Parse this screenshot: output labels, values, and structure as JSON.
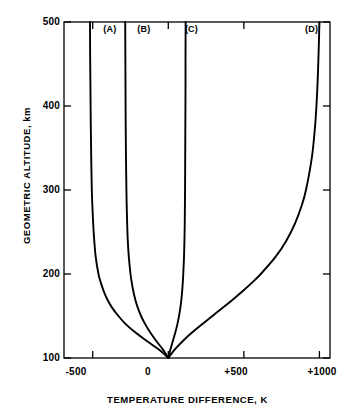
{
  "chart_data": {
    "type": "line",
    "title": "",
    "xlabel": "TEMPERATURE DIFFERENCE, K",
    "ylabel": "GEOMETRIC ALTITUDE, km",
    "xlim": [
      -690,
      1070
    ],
    "ylim": [
      100,
      500
    ],
    "xticks": [
      -500,
      0,
      500,
      1000
    ],
    "xticklabels": [
      "-500",
      "0",
      "+500",
      "+1000"
    ],
    "yticks": [
      100,
      200,
      300,
      400,
      500
    ],
    "yticklabels": [
      "100",
      "200",
      "300",
      "400",
      "500"
    ],
    "grid": false,
    "legend_position": "inline-at-curve-tops",
    "annotations": [
      {
        "text": "(A)",
        "x": -430,
        "y": 492
      },
      {
        "text": "(B)",
        "x": -205,
        "y": 492
      },
      {
        "text": "(C)",
        "x": 110,
        "y": 492
      },
      {
        "text": "(D)",
        "x": 905,
        "y": 492
      }
    ],
    "series": [
      {
        "name": "(A)",
        "label": "(A)",
        "color": "#000000",
        "points": [
          {
            "x": 0,
            "y": 100
          },
          {
            "x": -62,
            "y": 110
          },
          {
            "x": -140,
            "y": 120
          },
          {
            "x": -215,
            "y": 130
          },
          {
            "x": -280,
            "y": 140
          },
          {
            "x": -330,
            "y": 150
          },
          {
            "x": -372,
            "y": 160
          },
          {
            "x": -404,
            "y": 170
          },
          {
            "x": -428,
            "y": 180
          },
          {
            "x": -447,
            "y": 190
          },
          {
            "x": -462,
            "y": 200
          },
          {
            "x": -480,
            "y": 220
          },
          {
            "x": -490,
            "y": 240
          },
          {
            "x": -497,
            "y": 260
          },
          {
            "x": -502,
            "y": 280
          },
          {
            "x": -506,
            "y": 300
          },
          {
            "x": -510,
            "y": 340
          },
          {
            "x": -513,
            "y": 380
          },
          {
            "x": -515,
            "y": 420
          },
          {
            "x": -517,
            "y": 460
          },
          {
            "x": -518,
            "y": 500
          }
        ]
      },
      {
        "name": "(B)",
        "label": "(B)",
        "color": "#000000",
        "points": [
          {
            "x": 0,
            "y": 100
          },
          {
            "x": -35,
            "y": 110
          },
          {
            "x": -78,
            "y": 120
          },
          {
            "x": -118,
            "y": 130
          },
          {
            "x": -152,
            "y": 140
          },
          {
            "x": -180,
            "y": 150
          },
          {
            "x": -202,
            "y": 160
          },
          {
            "x": -219,
            "y": 170
          },
          {
            "x": -232,
            "y": 180
          },
          {
            "x": -242,
            "y": 190
          },
          {
            "x": -250,
            "y": 200
          },
          {
            "x": -261,
            "y": 220
          },
          {
            "x": -268,
            "y": 240
          },
          {
            "x": -272,
            "y": 260
          },
          {
            "x": -275,
            "y": 280
          },
          {
            "x": -277,
            "y": 300
          },
          {
            "x": -280,
            "y": 340
          },
          {
            "x": -282,
            "y": 380
          },
          {
            "x": -283,
            "y": 420
          },
          {
            "x": -284,
            "y": 460
          },
          {
            "x": -285,
            "y": 500
          }
        ]
      },
      {
        "name": "(C)",
        "label": "(C)",
        "color": "#000000",
        "points": [
          {
            "x": 0,
            "y": 100
          },
          {
            "x": 14,
            "y": 110
          },
          {
            "x": 30,
            "y": 120
          },
          {
            "x": 46,
            "y": 130
          },
          {
            "x": 60,
            "y": 140
          },
          {
            "x": 71,
            "y": 150
          },
          {
            "x": 80,
            "y": 160
          },
          {
            "x": 87,
            "y": 170
          },
          {
            "x": 92,
            "y": 180
          },
          {
            "x": 96,
            "y": 190
          },
          {
            "x": 99,
            "y": 200
          },
          {
            "x": 104,
            "y": 220
          },
          {
            "x": 107,
            "y": 240
          },
          {
            "x": 109,
            "y": 260
          },
          {
            "x": 110,
            "y": 280
          },
          {
            "x": 111,
            "y": 300
          },
          {
            "x": 112,
            "y": 340
          },
          {
            "x": 113,
            "y": 380
          },
          {
            "x": 114,
            "y": 420
          },
          {
            "x": 114,
            "y": 460
          },
          {
            "x": 115,
            "y": 500
          }
        ]
      },
      {
        "name": "(D)",
        "label": "(D)",
        "color": "#000000",
        "points": [
          {
            "x": 0,
            "y": 100
          },
          {
            "x": 42,
            "y": 110
          },
          {
            "x": 95,
            "y": 120
          },
          {
            "x": 155,
            "y": 130
          },
          {
            "x": 222,
            "y": 140
          },
          {
            "x": 292,
            "y": 150
          },
          {
            "x": 362,
            "y": 160
          },
          {
            "x": 430,
            "y": 170
          },
          {
            "x": 495,
            "y": 180
          },
          {
            "x": 556,
            "y": 190
          },
          {
            "x": 612,
            "y": 200
          },
          {
            "x": 708,
            "y": 220
          },
          {
            "x": 782,
            "y": 240
          },
          {
            "x": 838,
            "y": 260
          },
          {
            "x": 880,
            "y": 280
          },
          {
            "x": 911,
            "y": 300
          },
          {
            "x": 951,
            "y": 340
          },
          {
            "x": 973,
            "y": 380
          },
          {
            "x": 986,
            "y": 420
          },
          {
            "x": 994,
            "y": 460
          },
          {
            "x": 1000,
            "y": 500
          }
        ]
      }
    ]
  }
}
